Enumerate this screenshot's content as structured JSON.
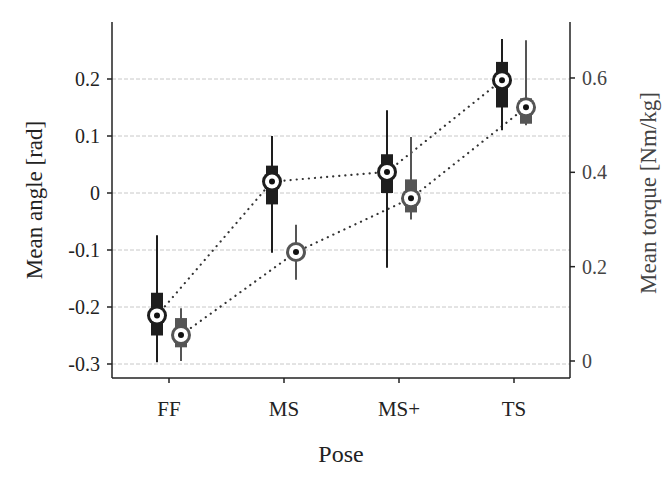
{
  "chart_data": {
    "type": "box",
    "title": "",
    "xlabel": "Pose",
    "ylabel_left": "Mean angle [rad]",
    "ylabel_right": "Mean torque [Nm/kg]",
    "categories": [
      "FF",
      "MS",
      "MS+",
      "TS"
    ],
    "ylim_left": [
      -0.31,
      0.26
    ],
    "ylim_right": [
      -0.035,
      0.72
    ],
    "yticks_left": [
      "0.2",
      "0.1",
      "0",
      "-0.1",
      "-0.2",
      "-0.3"
    ],
    "yticks_right": [
      "0.6",
      "0.4",
      "0.2",
      "0"
    ],
    "grid": "horizontal dashed",
    "series": [
      {
        "name": "Mean angle",
        "axis": "left",
        "color": "#1e1e1e",
        "medians": [
          -0.215,
          0.02,
          0.037,
          0.198
        ],
        "q1": [
          -0.25,
          -0.02,
          0.0,
          0.15
        ],
        "q3": [
          -0.175,
          0.048,
          0.068,
          0.23
        ],
        "whisker_low": [
          -0.297,
          -0.105,
          -0.131,
          0.11
        ],
        "whisker_high": [
          -0.074,
          0.1,
          0.145,
          0.27
        ]
      },
      {
        "name": "Mean torque",
        "axis": "right",
        "color": "#555555",
        "medians": [
          0.055,
          0.231,
          0.345,
          0.538
        ],
        "q1": [
          0.029,
          0.231,
          0.315,
          0.503
        ],
        "q3": [
          0.091,
          0.231,
          0.385,
          0.557
        ],
        "whisker_low": [
          0.0,
          0.172,
          0.3,
          0.5
        ],
        "whisker_high": [
          0.112,
          0.289,
          0.475,
          0.68
        ]
      }
    ]
  }
}
